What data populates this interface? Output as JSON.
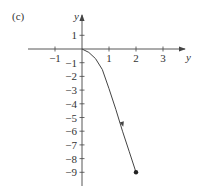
{
  "panel_label": "(c)",
  "chart_data": {
    "type": "line",
    "title": "",
    "xlabel": "y",
    "ylabel": "y",
    "xlim": [
      -2,
      4
    ],
    "ylim": [
      -10,
      2
    ],
    "grid": false,
    "x_ticks": [
      -1,
      1,
      2,
      3
    ],
    "x_tick_labels": [
      "−1",
      "1",
      "2",
      "3"
    ],
    "y_ticks": [
      1,
      -1,
      -2,
      -3,
      -4,
      -5,
      -6,
      -7,
      -8,
      -9
    ],
    "y_tick_labels": [
      "1",
      "−1",
      "−2",
      "−3",
      "−4",
      "−5",
      "−6",
      "−7",
      "−8",
      "−9"
    ],
    "series": [
      {
        "name": "solution curve",
        "x": [
          0,
          0.25,
          0.5,
          0.75,
          1.0,
          1.25,
          1.5,
          1.75,
          2.0
        ],
        "y": [
          0,
          -0.25,
          -0.7,
          -1.5,
          -2.9,
          -4.4,
          -6.0,
          -7.5,
          -9.0
        ],
        "direction_arrow_at": [
          1.5,
          -5.5
        ],
        "endpoint": [
          2,
          -9
        ]
      }
    ]
  },
  "colors": {
    "axis": "#444444",
    "curve": "#444444",
    "text": "#333333"
  }
}
